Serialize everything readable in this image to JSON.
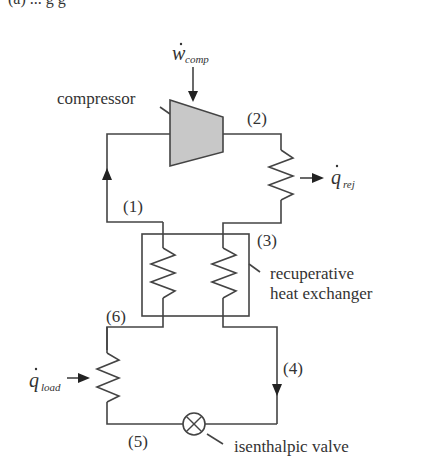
{
  "caption_partial": "(a) ... g g",
  "labels": {
    "work_input": {
      "symbol": "w",
      "subscript": "comp"
    },
    "heat_rejected": {
      "symbol": "q",
      "subscript": "rej"
    },
    "heat_load": {
      "symbol": "q",
      "subscript": "load"
    },
    "compressor": "compressor",
    "recuperator_line1": "recuperative",
    "recuperator_line2": "heat exchanger",
    "valve": "isenthalpic valve"
  },
  "state_points": {
    "s1": "(1)",
    "s2": "(2)",
    "s3": "(3)",
    "s4": "(4)",
    "s5": "(5)",
    "s6": "(6)"
  },
  "colors": {
    "line": "#444444",
    "compressor_fill": "#c8c8c8",
    "text": "#333333"
  }
}
